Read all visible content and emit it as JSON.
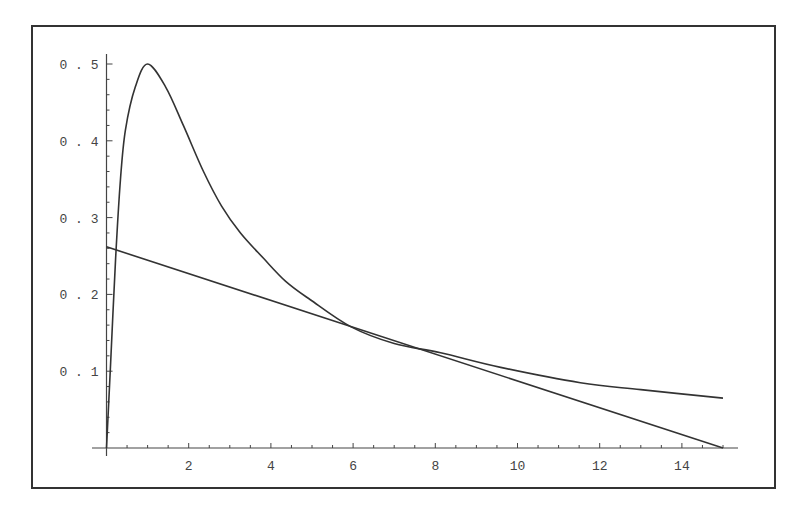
{
  "chart_data": {
    "type": "line",
    "title": "",
    "xlabel": "",
    "ylabel": "",
    "xlim": [
      0,
      15
    ],
    "ylim": [
      0,
      0.5
    ],
    "grid": false,
    "legend": null,
    "x_ticks": [
      2,
      4,
      6,
      8,
      10,
      12,
      14
    ],
    "x_tick_labels": [
      "2",
      "4",
      "6",
      "8",
      "10",
      "12",
      "14"
    ],
    "y_ticks": [
      0.1,
      0.2,
      0.3,
      0.4,
      0.5
    ],
    "y_tick_labels": [
      "0.1",
      "0.2",
      "0.3",
      "0.4",
      "0.5"
    ],
    "series": [
      {
        "name": "curve",
        "x": [
          0,
          0.1,
          0.22,
          0.34,
          0.46,
          0.7,
          1.0,
          1.44,
          1.87,
          2.36,
          2.8,
          3.26,
          3.82,
          4.36,
          4.96,
          5.94,
          7.0,
          8.13,
          9.59,
          11.53,
          13.0,
          15.0
        ],
        "y": [
          0,
          0.11,
          0.245,
          0.35,
          0.414,
          0.47,
          0.5,
          0.47,
          0.42,
          0.36,
          0.315,
          0.28,
          0.247,
          0.217,
          0.193,
          0.158,
          0.136,
          0.124,
          0.105,
          0.085,
          0.076,
          0.065
        ]
      },
      {
        "name": "tangent-line",
        "x": [
          0,
          15
        ],
        "y": [
          0.262,
          0
        ]
      }
    ],
    "colors": {
      "axis": "#444444",
      "line": "#333333",
      "frame": "#333333"
    }
  }
}
